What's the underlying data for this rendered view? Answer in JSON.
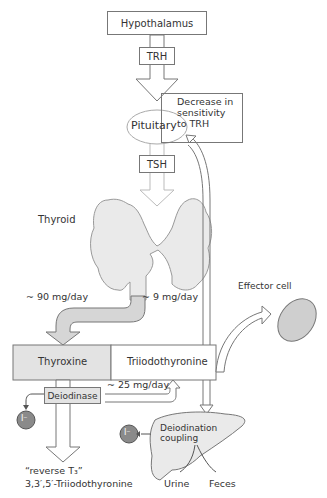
{
  "diagram": {
    "nodes": {
      "hypothalamus": "Hypothalamus",
      "trh": "TRH",
      "feedback_note": [
        "Decrease in",
        "sensitivity",
        "to TRH"
      ],
      "pituitary": "Pituitary",
      "tsh": "TSH",
      "thyroid": "Thyroid",
      "thyroxine": "Thyroxine",
      "triiodothyronine": "Triiodothyronine",
      "effector_cell": "Effector cell",
      "deiodinase": "Deiodinase",
      "iodide_ion": "I⁻",
      "deiodination_coupling": [
        "Deiodination",
        "coupling"
      ],
      "urine": "Urine",
      "feces": "Feces",
      "reverse_t3_line1": "“reverse T₃”",
      "reverse_t3_line2": "3,3′,5′-Triiodothyronine"
    },
    "rates": {
      "thyroxine_rate": "~ 90 mg/day",
      "t3_rate": "~ 9 mg/day",
      "conversion_rate": "~ 25 mg/day"
    },
    "colors": {
      "box_fill": "#e3e3e3",
      "organ_fill": "#e8e8e8",
      "ion_fill": "#8a8a8a",
      "stroke": "#777777"
    }
  }
}
